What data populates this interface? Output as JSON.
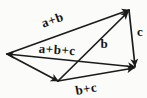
{
  "figure": {
    "type": "vector-addition-diagram",
    "colors": {
      "ink": "#1b1b1b",
      "background": "#fbfbfa"
    },
    "labels": {
      "a_plus_b": "a+b",
      "a_plus_b_plus_c": "a+b+c",
      "b": "b",
      "c": "c",
      "b_plus_c": "b+c"
    },
    "vectors": [
      {
        "label": "a+b",
        "from": "left-vertex",
        "to": "top-vertex"
      },
      {
        "label": "a+b+c",
        "from": "left-vertex",
        "to": "right-vertex"
      },
      {
        "label": "",
        "from": "left-vertex",
        "to": "bottom-vertex"
      },
      {
        "label": "b",
        "from": "bottom-vertex",
        "to": "top-vertex"
      },
      {
        "label": "b+c",
        "from": "bottom-vertex",
        "to": "right-vertex"
      },
      {
        "label": "c",
        "from": "top-vertex",
        "to": "right-vertex"
      }
    ]
  }
}
